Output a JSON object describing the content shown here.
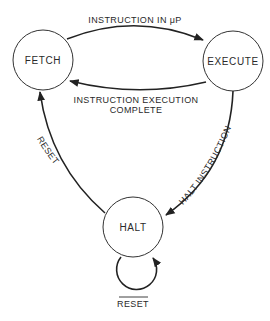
{
  "diagram": {
    "type": "state-diagram",
    "states": [
      {
        "id": "fetch",
        "label": "FETCH"
      },
      {
        "id": "execute",
        "label": "EXECUTE"
      },
      {
        "id": "halt",
        "label": "HALT"
      }
    ],
    "transitions": [
      {
        "from": "fetch",
        "to": "execute",
        "label": "INSTRUCTION IN μP"
      },
      {
        "from": "execute",
        "to": "fetch",
        "label_line1": "INSTRUCTION EXECUTION",
        "label_line2": "COMPLETE"
      },
      {
        "from": "execute",
        "to": "halt",
        "label": "HALT INSTRUCTION"
      },
      {
        "from": "halt",
        "to": "fetch",
        "label": "RESET"
      },
      {
        "from": "halt",
        "to": "halt",
        "label": "RESET",
        "label_overline": true
      }
    ],
    "colors": {
      "stroke": "#222222",
      "text": "#2a2a2a",
      "background": "#ffffff"
    }
  }
}
